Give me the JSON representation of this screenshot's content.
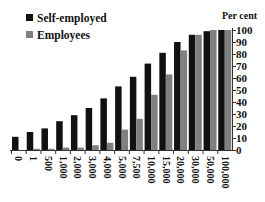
{
  "chart_data": {
    "type": "bar",
    "title": "",
    "xlabel": "",
    "ylabel": "Per cent",
    "ylim": [
      0,
      100
    ],
    "yticks": [
      0,
      10,
      20,
      30,
      40,
      50,
      60,
      70,
      80,
      90,
      100
    ],
    "grid": false,
    "legend_position": "top-left",
    "categories": [
      "0",
      "1",
      "500",
      "1,000",
      "2,000",
      "3,000",
      "4,000",
      "5,000",
      "7,500",
      "10,000",
      "15,000",
      "20,000",
      "30,000",
      "50,000",
      "100,000"
    ],
    "series": [
      {
        "name": "Self-employed",
        "color": "#111111",
        "values": [
          11,
          15,
          18,
          24,
          29,
          35,
          43,
          53,
          61,
          72,
          81,
          90,
          96,
          99,
          100
        ]
      },
      {
        "name": "Employees",
        "color": "#808080",
        "values": [
          0,
          1,
          1,
          2,
          2,
          4,
          6,
          17,
          26,
          46,
          63,
          83,
          96,
          100,
          100
        ]
      }
    ]
  },
  "legend": {
    "items": [
      "Self-employed",
      "Employees"
    ]
  },
  "axis": {
    "unit_label": "Per cent"
  }
}
